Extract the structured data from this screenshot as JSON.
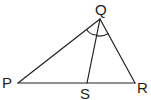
{
  "diagram": {
    "type": "triangle-with-angle-bisector",
    "stroke_color": "#222222",
    "background": "#ffffff",
    "vertices": {
      "P": {
        "label": "P",
        "x": 18,
        "y": 83
      },
      "Q": {
        "label": "Q",
        "x": 100,
        "y": 19
      },
      "R": {
        "label": "R",
        "x": 135,
        "y": 83
      },
      "S": {
        "label": "S",
        "x": 87,
        "y": 83
      }
    },
    "segments": [
      "PQ",
      "QR",
      "PR",
      "QS"
    ],
    "angle_marks": [
      {
        "vertex": "Q",
        "between": [
          "QP",
          "QS"
        ],
        "style": "single-arc"
      },
      {
        "vertex": "Q",
        "between": [
          "QS",
          "QR"
        ],
        "style": "single-arc"
      }
    ]
  }
}
